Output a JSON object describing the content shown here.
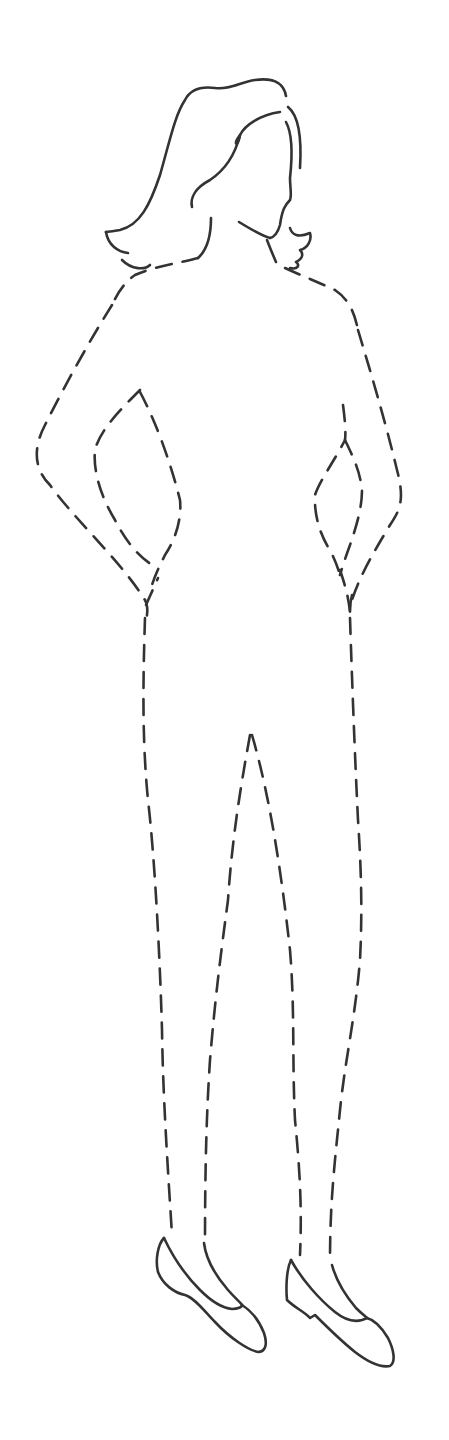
{
  "illustration": {
    "subject": "Dashed outline figure of a standing woman (croquis)",
    "background_color": "#ffffff",
    "line_color": "#333333",
    "parts": [
      {
        "name": "hair",
        "style": "solid"
      },
      {
        "name": "face-profile",
        "style": "solid"
      },
      {
        "name": "neck",
        "style": "solid"
      },
      {
        "name": "shoulders",
        "style": "dashed"
      },
      {
        "name": "left-arm",
        "style": "dashed"
      },
      {
        "name": "right-arm",
        "style": "dashed"
      },
      {
        "name": "torso-legs",
        "style": "dashed"
      },
      {
        "name": "left-shoe",
        "style": "solid"
      },
      {
        "name": "right-shoe",
        "style": "solid"
      }
    ]
  }
}
